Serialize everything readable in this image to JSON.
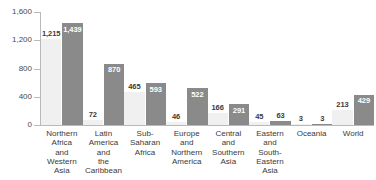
{
  "chart_data": {
    "type": "bar",
    "title": "",
    "subtitle": "",
    "xlabel": "",
    "ylabel": "",
    "ylim": [
      0,
      1600
    ],
    "yticks": [
      0,
      400,
      800,
      1200,
      1600
    ],
    "ytick_labels": [
      "0",
      "400",
      "800",
      "1,200",
      "1,600"
    ],
    "grid": false,
    "legend_position": "none",
    "categories": [
      "Northern\nAfrica\nand\nWestern\nAsia",
      "Latin\nAmerica\nand\nthe\nCaribbean",
      "Sub-\nSaharan\nAfrica",
      "Europe\nand\nNorthern\nAmerica",
      "Central\nand\nSouthern\nAsia",
      "Eastern\nand\nSouth-\nEastern\nAsia",
      "Oceania",
      "World"
    ],
    "series": [
      {
        "name": "light",
        "color": "#f0f0f0",
        "values": [
          1215,
          72,
          465,
          46,
          166,
          45,
          3,
          213
        ],
        "value_labels": [
          "1,215",
          "72",
          "465",
          "46",
          "166",
          "45",
          "3",
          "213"
        ]
      },
      {
        "name": "dark",
        "color": "#8a8a8a",
        "values": [
          1439,
          870,
          593,
          522,
          291,
          63,
          3,
          429
        ],
        "value_labels": [
          "1,439",
          "870",
          "593",
          "522",
          "291",
          "63",
          "3",
          "429"
        ]
      }
    ]
  },
  "axis": {
    "line_color": "#b9b9b9"
  }
}
